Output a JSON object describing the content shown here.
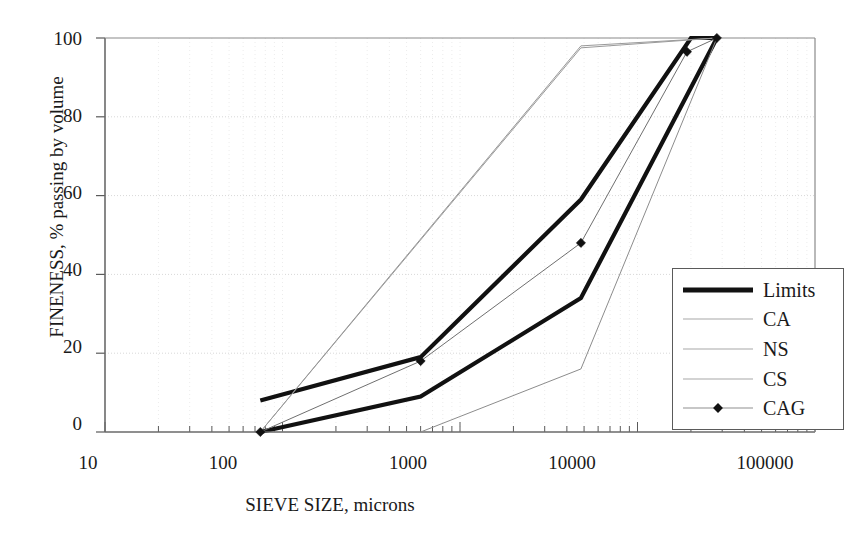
{
  "chart_data": {
    "type": "line",
    "title": "",
    "xlabel": "SIEVE SIZE, microns",
    "ylabel": "FINENESS, % passing by volume",
    "xscale": "log",
    "xlim": [
      10,
      100000
    ],
    "ylim": [
      0,
      100
    ],
    "xticks": [
      10,
      100,
      1000,
      10000,
      100000
    ],
    "xtick_labels": [
      "10",
      "100",
      "1000",
      "10000",
      "100000"
    ],
    "yticks": [
      0,
      20,
      40,
      60,
      80,
      100
    ],
    "ytick_labels": [
      "0",
      "20",
      "40",
      "60",
      "80",
      "100"
    ],
    "grid": "both-faint",
    "legend_position": "right-lower",
    "series": [
      {
        "name": "Limits",
        "style": "thick-solid-black",
        "color": "#111111",
        "width": 4.2,
        "marker": "none",
        "note": "upper limit envelope",
        "points": [
          [
            75,
            8
          ],
          [
            600,
            19
          ],
          [
            4800,
            59
          ],
          [
            20000,
            100
          ],
          [
            28000,
            100
          ]
        ]
      },
      {
        "name": "Limits",
        "style": "thick-solid-black",
        "color": "#111111",
        "width": 4.2,
        "marker": "none",
        "note": "lower limit envelope",
        "points": [
          [
            75,
            0
          ],
          [
            600,
            9
          ],
          [
            4800,
            34
          ],
          [
            28000,
            100
          ]
        ]
      },
      {
        "name": "CA",
        "style": "thin-solid-gray",
        "color": "#9a9a9a",
        "width": 1,
        "marker": "none",
        "points": [
          [
            75,
            0
          ],
          [
            4800,
            98
          ],
          [
            28000,
            100
          ]
        ]
      },
      {
        "name": "NS",
        "style": "thin-solid-gray",
        "color": "#9a9a9a",
        "width": 1,
        "marker": "none",
        "points": [
          [
            75,
            0
          ],
          [
            4800,
            97.5
          ],
          [
            28000,
            100
          ]
        ]
      },
      {
        "name": "CS",
        "style": "thin-solid-gray",
        "color": "#8c8c8c",
        "width": 1,
        "marker": "none",
        "points": [
          [
            75,
            0
          ],
          [
            600,
            0
          ],
          [
            4800,
            16
          ],
          [
            28000,
            100
          ]
        ]
      },
      {
        "name": "CAG",
        "style": "thin-solid-with-diamond",
        "color": "#6f6f6f",
        "width": 1,
        "marker": "diamond",
        "points": [
          [
            75,
            0
          ],
          [
            600,
            18
          ],
          [
            4800,
            48
          ],
          [
            19000,
            96.5
          ],
          [
            28000,
            100
          ]
        ]
      }
    ]
  },
  "axes": {
    "y_title": "FINENESS, % passing by volume",
    "x_title": "SIEVE SIZE, microns",
    "y_tick_labels": [
      "100",
      "80",
      "60",
      "40",
      "20",
      "0"
    ],
    "x_tick_labels": [
      "10",
      "100",
      "1000",
      "10000",
      "100000"
    ]
  },
  "legend": {
    "items": [
      {
        "label": "Limits",
        "swatch": "thick-black-line",
        "marker": "none"
      },
      {
        "label": "CA",
        "swatch": "thin-gray-line",
        "marker": "none"
      },
      {
        "label": "NS",
        "swatch": "thin-gray-line",
        "marker": "none"
      },
      {
        "label": "CS",
        "swatch": "thin-gray-line",
        "marker": "none"
      },
      {
        "label": "CAG",
        "swatch": "thin-gray-line",
        "marker": "diamond"
      }
    ]
  },
  "colors": {
    "limits": "#111111",
    "thin_series": "#9a9a9a",
    "axis": "#5a5a5a",
    "grid": "#dddddd",
    "text": "#1a1a1a",
    "background": "#ffffff"
  }
}
